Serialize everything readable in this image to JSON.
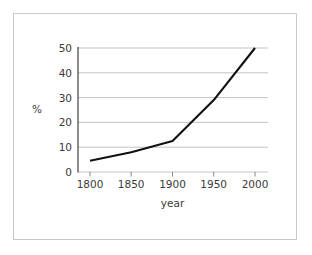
{
  "chart_data": {
    "type": "line",
    "title": "",
    "subtitle": "",
    "xlabel": "year",
    "ylabel": "%",
    "x": [
      1800,
      1850,
      1900,
      1950,
      2000
    ],
    "values": [
      4.5,
      8,
      12.5,
      29,
      50
    ],
    "series": [
      {
        "name": "",
        "values": [
          4.5,
          8,
          12.5,
          29,
          50
        ],
        "color": "#111111"
      }
    ],
    "xlim": [
      1775,
      2025
    ],
    "ylim": [
      0,
      50
    ],
    "xticks": [
      1800,
      1850,
      1900,
      1950,
      2000
    ],
    "xticklabels": [
      "1800",
      "1850",
      "1900",
      "1950",
      "2000"
    ],
    "yticks": [
      0,
      10,
      20,
      30,
      40,
      50
    ],
    "yticklabels": [
      "0",
      "10",
      "20",
      "30",
      "40",
      "50"
    ],
    "grid": "horizontal",
    "legend": "none",
    "annotations": [],
    "colors": {
      "line": "#111111",
      "gridline": "#b4b4b4",
      "axis": "#1a1a1a",
      "text": "#3a3a3a",
      "frame": "#c9c9c9",
      "background": "#ffffff"
    }
  },
  "axis_labels": {
    "y": "%",
    "x": "year"
  },
  "y_ticks": {
    "t0": "0",
    "t1": "10",
    "t2": "20",
    "t3": "30",
    "t4": "40",
    "t5": "50"
  },
  "x_ticks": {
    "t0": "1800",
    "t1": "1850",
    "t2": "1900",
    "t3": "1950",
    "t4": "2000"
  }
}
